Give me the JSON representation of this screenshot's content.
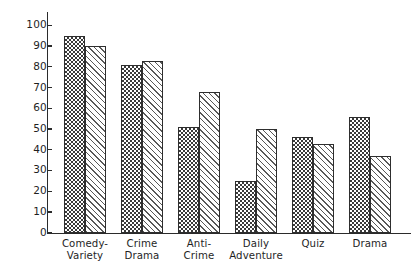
{
  "chart_data": {
    "type": "bar",
    "title": "",
    "subtitle": "",
    "xlabel": "",
    "ylabel": "",
    "ylim": [
      0,
      100
    ],
    "yticks": [
      0,
      10,
      20,
      30,
      40,
      50,
      60,
      70,
      80,
      90,
      100
    ],
    "ytick_labels": [
      "0",
      "10",
      "20",
      "30",
      "40",
      "50",
      "60",
      "70",
      "80",
      "90",
      "100"
    ],
    "grid": false,
    "legend": null,
    "categories": [
      "Comedy-Variety",
      "Crime Drama",
      "Anti-Crime",
      "Daily Adventure",
      "Quiz",
      "Drama"
    ],
    "category_lines": [
      [
        "Comedy-",
        "Variety"
      ],
      [
        "Crime",
        "Drama"
      ],
      [
        "Anti-",
        "Crime"
      ],
      [
        "Daily",
        "Adventure"
      ],
      [
        "Quiz",
        ""
      ],
      [
        "Drama",
        ""
      ]
    ],
    "series": [
      {
        "name": "series-1",
        "pattern": "checkerboard",
        "color": "#3a3a3a",
        "values": [
          95,
          81,
          51,
          25,
          46,
          56
        ]
      },
      {
        "name": "series-2",
        "pattern": "diagonal-hatch",
        "color": "#585858",
        "values": [
          90,
          83,
          68,
          50,
          43,
          37
        ]
      }
    ]
  },
  "axis": {
    "y_top_label": "100",
    "y_bottom_label": "0"
  }
}
